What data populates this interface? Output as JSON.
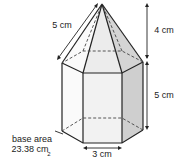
{
  "diagram": {
    "orientation": "rotated 180 degrees",
    "labels": {
      "top_edge": "3 cm",
      "prism_height": "5 cm",
      "pyramid_height": "4 cm",
      "slant_edge": "5 cm",
      "base_area_line1": "base area",
      "base_area_line2": "23.38 cm",
      "base_area_sup": "2"
    },
    "colors": {
      "stroke": "#222222",
      "shade_dark": "#cfcfcf",
      "shade_light": "#ececec",
      "face": "#f5f5f5"
    }
  }
}
